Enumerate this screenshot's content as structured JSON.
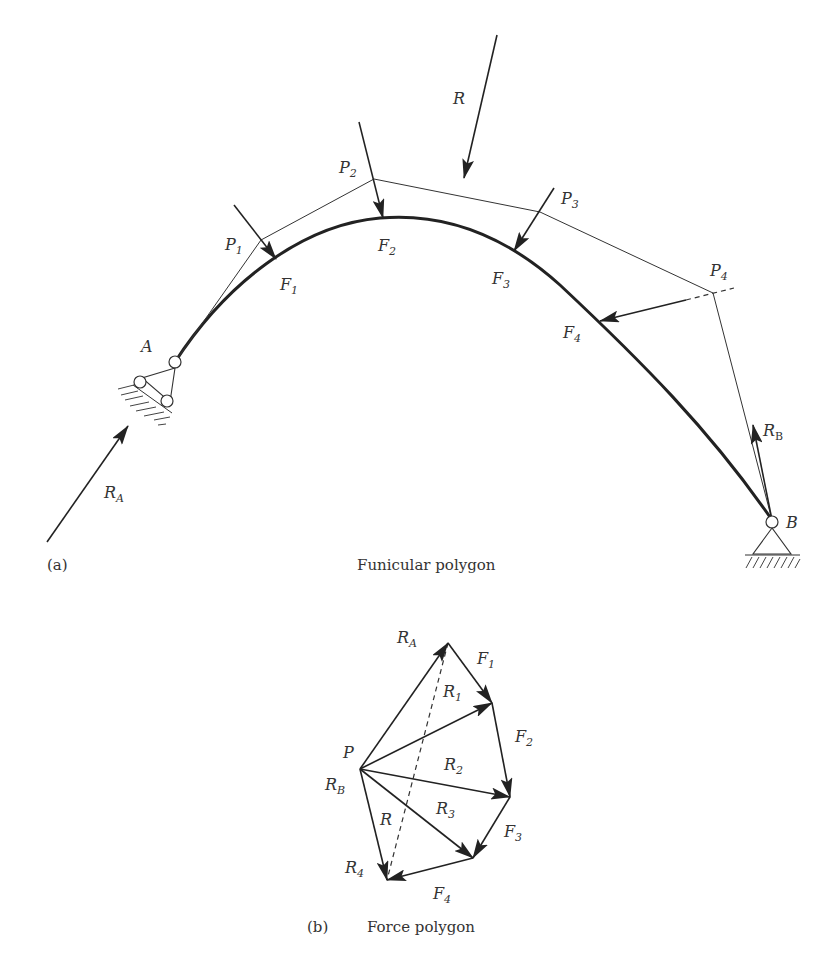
{
  "funicular": {
    "caption_tag": "(a)",
    "caption": "Funicular polygon",
    "labels": {
      "R": "R",
      "P1": "P",
      "P1_sub": "1",
      "P2": "P",
      "P2_sub": "2",
      "P3": "P",
      "P3_sub": "3",
      "P4": "P",
      "P4_sub": "4",
      "F1": "F",
      "F1_sub": "1",
      "F2": "F",
      "F2_sub": "2",
      "F3": "F",
      "F3_sub": "3",
      "F4": "F",
      "F4_sub": "4",
      "A": "A",
      "B": "B",
      "RA": "R",
      "RA_sub": "A",
      "RB": "R",
      "RB_sub": "B"
    }
  },
  "force_polygon": {
    "caption_tag": "(b)",
    "caption": "Force polygon",
    "labels": {
      "P": "P",
      "RA": "R",
      "RA_sub": "A",
      "RB": "R",
      "RB_sub": "B",
      "R": "R",
      "R1": "R",
      "R1_sub": "1",
      "R2": "R",
      "R2_sub": "2",
      "R3": "R",
      "R3_sub": "3",
      "R4": "R",
      "R4_sub": "4",
      "F1": "F",
      "F1_sub": "1",
      "F2": "F",
      "F2_sub": "2",
      "F3": "F",
      "F3_sub": "3",
      "F4": "F",
      "F4_sub": "4"
    }
  }
}
